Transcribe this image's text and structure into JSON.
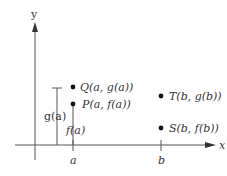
{
  "axes": {
    "x_label": "x",
    "y_label": "y"
  },
  "ticks": {
    "a": "a",
    "b": "b"
  },
  "points": [
    {
      "id": "Q",
      "label": "Q(a, g(a))"
    },
    {
      "id": "P",
      "label": "P(a, f(a))"
    },
    {
      "id": "T",
      "label": "T(b, g(b))"
    },
    {
      "id": "S",
      "label": "S(b, f(b))"
    }
  ],
  "measures": {
    "g_a": "g(a)",
    "f_a": "f(a)"
  },
  "colors": {
    "line": "#444444",
    "dot": "#111111"
  }
}
